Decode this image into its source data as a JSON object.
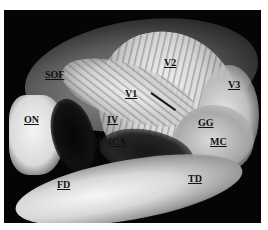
{
  "figure": {
    "background_color": "#050505",
    "label_color": "#111111",
    "labels": [
      {
        "id": "sof",
        "text": "SOF",
        "x": 45,
        "y": 70
      },
      {
        "id": "v2",
        "text": "V2",
        "x": 164,
        "y": 58
      },
      {
        "id": "v3",
        "text": "V3",
        "x": 228,
        "y": 80
      },
      {
        "id": "v1",
        "text": "V1",
        "x": 125,
        "y": 89
      },
      {
        "id": "on",
        "text": "ON",
        "x": 24,
        "y": 115
      },
      {
        "id": "iv",
        "text": "IV",
        "x": 107,
        "y": 115
      },
      {
        "id": "iii",
        "text": "III",
        "x": 90,
        "y": 137
      },
      {
        "id": "ica",
        "text": "ICA",
        "x": 108,
        "y": 137
      },
      {
        "id": "gg",
        "text": "GG",
        "x": 198,
        "y": 118
      },
      {
        "id": "mc",
        "text": "MC",
        "x": 210,
        "y": 137
      },
      {
        "id": "fd",
        "text": "FD",
        "x": 57,
        "y": 180
      },
      {
        "id": "td",
        "text": "TD",
        "x": 188,
        "y": 174
      }
    ]
  }
}
